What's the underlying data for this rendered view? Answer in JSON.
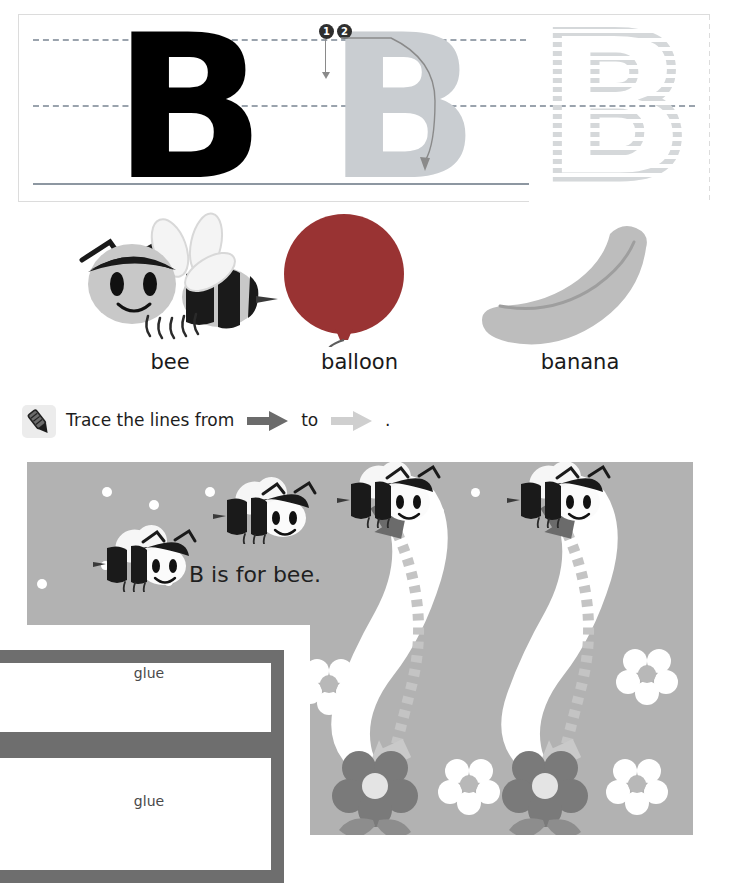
{
  "worksheet": {
    "letter": "B",
    "letter_practice": {
      "solid_letter": "B",
      "ghost_letter": "B",
      "dotted_letter": "B",
      "stroke_order": [
        {
          "number": "1",
          "direction": "down"
        },
        {
          "number": "2",
          "direction": "curve-right"
        }
      ]
    },
    "pictures": [
      {
        "label": "bee",
        "icon": "bee-icon"
      },
      {
        "label": "balloon",
        "icon": "balloon-icon"
      },
      {
        "label": "banana",
        "icon": "banana-icon"
      }
    ],
    "instruction": {
      "icon": "crayon-icon",
      "text_before": "Trace the lines from",
      "text_middle": "to",
      "text_after": ".",
      "start_arrow": "dark-arrow-icon",
      "end_arrow": "light-arrow-icon"
    },
    "activity": {
      "caption": "B is for bee.",
      "trace_count": 2,
      "trace_shape": "banana",
      "decorations": [
        "bee-icon",
        "flower-icon",
        "dot-icon"
      ]
    },
    "glue_tabs": [
      {
        "label": "glue"
      },
      {
        "label": "glue"
      }
    ]
  },
  "colors": {
    "letter_solid": "#000000",
    "letter_ghost": "#c9cdd1",
    "letter_dotted": "#d5d8da",
    "guide_line": "#9aa3ad",
    "panel_bg": "#b2b2b2",
    "balloon": "#993333",
    "banana": "#bdbdbd",
    "flower_dark": "#7a7a7a",
    "arrow_dark": "#6b6b6b",
    "arrow_light": "#cfcfcf",
    "glue_border": "#6e6e6e"
  }
}
